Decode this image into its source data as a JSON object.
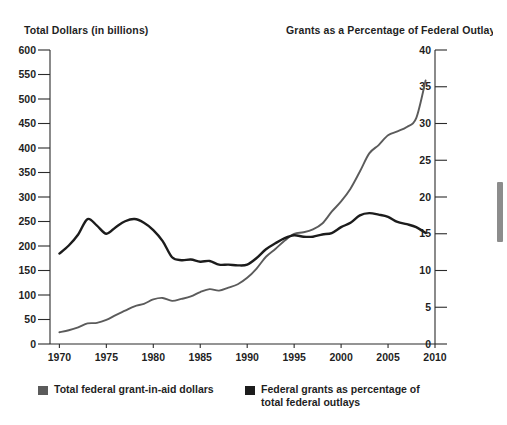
{
  "titles": {
    "left_axis": "Total Dollars (in billions)",
    "right_axis": "Grants as a Percentage of Federal Outlays"
  },
  "legend": {
    "items": [
      {
        "label": "Total federal grant-in-aid dollars",
        "color": "#5b5b5b",
        "swatch_name": "legend-swatch-dollars"
      },
      {
        "label": "Federal grants as percentage of total federal outlays",
        "color": "#1c1c1c",
        "swatch_name": "legend-swatch-percent"
      }
    ]
  },
  "chart_data": {
    "type": "line",
    "title": "",
    "xlabel": "",
    "ylabel": "Total Dollars (in billions)",
    "y2label": "Grants as a Percentage of Federal Outlays",
    "xlim": [
      1969,
      2010
    ],
    "ylim": [
      0,
      600
    ],
    "y2lim": [
      0,
      40
    ],
    "grid": false,
    "legend_position": "bottom-left",
    "xticks": [
      1970,
      1975,
      1980,
      1985,
      1990,
      1995,
      2000,
      2005,
      2010
    ],
    "yticks": [
      0,
      50,
      100,
      150,
      200,
      250,
      300,
      350,
      400,
      450,
      500,
      550,
      600
    ],
    "y2ticks": [
      0,
      5,
      10,
      15,
      20,
      25,
      30,
      35,
      40
    ],
    "x": [
      1970,
      1971,
      1972,
      1973,
      1974,
      1975,
      1976,
      1977,
      1978,
      1979,
      1980,
      1981,
      1982,
      1983,
      1984,
      1985,
      1986,
      1987,
      1988,
      1989,
      1990,
      1991,
      1992,
      1993,
      1994,
      1995,
      1996,
      1997,
      1998,
      1999,
      2000,
      2001,
      2002,
      2003,
      2004,
      2005,
      2006,
      2007,
      2008,
      2009
    ],
    "series": [
      {
        "name": "Total federal grant-in-aid dollars",
        "axis": "left",
        "units": "billions of dollars",
        "color": "#5b5b5b",
        "values": [
          24,
          28,
          34,
          42,
          43,
          49,
          59,
          68,
          77,
          82,
          91,
          94,
          88,
          92,
          97,
          106,
          112,
          109,
          115,
          122,
          135,
          154,
          178,
          194,
          211,
          225,
          228,
          234,
          246,
          270,
          291,
          317,
          352,
          389,
          406,
          426,
          434,
          443,
          461,
          538
        ]
      },
      {
        "name": "Federal grants as percentage of total federal outlays",
        "axis": "right",
        "units": "percent",
        "color": "#1c1c1c",
        "values": [
          12.3,
          13.4,
          14.9,
          17.0,
          16.1,
          15.0,
          15.9,
          16.7,
          17.0,
          16.5,
          15.5,
          14.0,
          11.8,
          11.4,
          11.5,
          11.2,
          11.3,
          10.8,
          10.8,
          10.7,
          10.8,
          11.7,
          12.9,
          13.7,
          14.4,
          14.8,
          14.6,
          14.6,
          14.9,
          15.1,
          15.9,
          16.5,
          17.5,
          17.8,
          17.6,
          17.3,
          16.6,
          16.3,
          15.9,
          15.1
        ]
      }
    ]
  },
  "scrollbar": {
    "name": "vertical-scrollbar"
  }
}
